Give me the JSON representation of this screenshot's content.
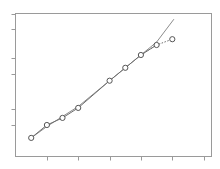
{
  "chart_data": {
    "type": "line",
    "title": "",
    "xlabel": "",
    "ylabel": "",
    "x_tick_labels": [
      "",
      "",
      "",
      "",
      "",
      ""
    ],
    "y_tick_labels": [
      "",
      "",
      "",
      "",
      "",
      ""
    ],
    "grid": false,
    "legend": null,
    "xlim": [
      0,
      12.5
    ],
    "ylim": [
      0,
      10
    ],
    "x_ticks": [
      2,
      4,
      6,
      8,
      10,
      12
    ],
    "y_ticks": [
      2.2,
      3.3,
      5.8,
      6.9,
      8.9,
      10
    ],
    "series": [
      {
        "name": "observed",
        "style": "markers, solid then dotted",
        "x": [
          1,
          2,
          3,
          4,
          6,
          7,
          8,
          9,
          10
        ],
        "y": [
          1.3,
          2.2,
          2.7,
          3.4,
          5.3,
          6.2,
          7.1,
          7.8,
          8.2
        ]
      },
      {
        "name": "fit",
        "style": "solid line",
        "x": [
          1,
          2,
          3,
          4,
          5,
          6,
          7,
          8,
          9,
          10.1
        ],
        "y": [
          1.3,
          2.1,
          2.8,
          3.5,
          4.4,
          5.3,
          6.2,
          7.1,
          8.0,
          9.6
        ]
      }
    ]
  },
  "colors": {
    "frame": "#9a9a9a",
    "fit_line": "#8c8c8c",
    "data_line": "#6e6e6e",
    "marker_edge": "#555555",
    "background": "#ffffff"
  }
}
